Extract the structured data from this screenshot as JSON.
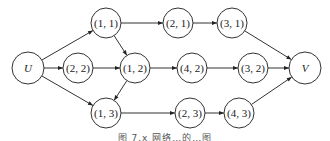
{
  "diagram": {
    "type": "directed-network",
    "nodes": [
      {
        "id": "U",
        "label": "U",
        "x": 28,
        "y": 68,
        "r": 16,
        "italic": true
      },
      {
        "id": "n11",
        "label": "(1, 1)",
        "x": 106,
        "y": 23,
        "r": 15,
        "italic": false
      },
      {
        "id": "n21",
        "label": "(2, 1)",
        "x": 178,
        "y": 23,
        "r": 15,
        "italic": false
      },
      {
        "id": "n31",
        "label": "(3, 1)",
        "x": 232,
        "y": 23,
        "r": 15,
        "italic": false
      },
      {
        "id": "n22",
        "label": "(2, 2)",
        "x": 78,
        "y": 68,
        "r": 15,
        "italic": false
      },
      {
        "id": "n12",
        "label": "(1, 2)",
        "x": 135,
        "y": 68,
        "r": 15,
        "italic": false
      },
      {
        "id": "n42",
        "label": "(4, 2)",
        "x": 192,
        "y": 68,
        "r": 15,
        "italic": false
      },
      {
        "id": "n32",
        "label": "(3, 2)",
        "x": 253,
        "y": 68,
        "r": 15,
        "italic": false
      },
      {
        "id": "V",
        "label": "V",
        "x": 305,
        "y": 68,
        "r": 16,
        "italic": true
      },
      {
        "id": "n13",
        "label": "(1, 3)",
        "x": 106,
        "y": 113,
        "r": 15,
        "italic": false
      },
      {
        "id": "n23",
        "label": "(2, 3)",
        "x": 190,
        "y": 113,
        "r": 15,
        "italic": false
      },
      {
        "id": "n43",
        "label": "(4, 3)",
        "x": 239,
        "y": 113,
        "r": 15,
        "italic": false
      }
    ],
    "edges": [
      {
        "from": "U",
        "to": "n11"
      },
      {
        "from": "U",
        "to": "n22"
      },
      {
        "from": "U",
        "to": "n13"
      },
      {
        "from": "n11",
        "to": "n21"
      },
      {
        "from": "n11",
        "to": "n12"
      },
      {
        "from": "n21",
        "to": "n31"
      },
      {
        "from": "n31",
        "to": "V"
      },
      {
        "from": "n22",
        "to": "n12"
      },
      {
        "from": "n12",
        "to": "n42"
      },
      {
        "from": "n12",
        "to": "n13"
      },
      {
        "from": "n42",
        "to": "n32"
      },
      {
        "from": "n32",
        "to": "V"
      },
      {
        "from": "n13",
        "to": "n23"
      },
      {
        "from": "n23",
        "to": "n43"
      },
      {
        "from": "n43",
        "to": "V"
      }
    ]
  },
  "caption": "图 7.x   网络…的…图"
}
